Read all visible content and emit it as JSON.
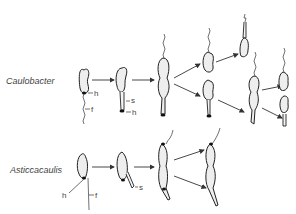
{
  "figure": {
    "rows": [
      {
        "organism": "Caulobacter",
        "part_labels": {
          "holdfast": "h",
          "flagellum": "f",
          "stalk": "s",
          "holdfast_on_stalk": "h"
        }
      },
      {
        "organism": "Asticcacaulis",
        "part_labels": {
          "holdfast": "h",
          "flagellum": "f",
          "stalk": "s"
        }
      }
    ],
    "colors": {
      "ink": "#222222",
      "cell_fill": "#eeeeee",
      "background": "#ffffff"
    }
  }
}
